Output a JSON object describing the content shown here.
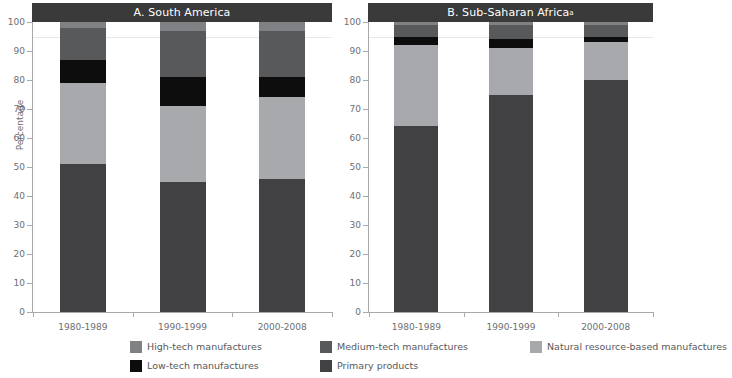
{
  "axis": {
    "ylabel": "Percentage",
    "yticks": [
      0,
      10,
      20,
      30,
      40,
      50,
      60,
      70,
      80,
      90,
      100
    ],
    "ylim": [
      0,
      100
    ]
  },
  "panels": [
    {
      "title": "A. South America",
      "superscript": ""
    },
    {
      "title": "B. Sub-Saharan Africa",
      "superscript": "a"
    }
  ],
  "categories": [
    "1980-1989",
    "1990-1999",
    "2000-2008"
  ],
  "legend": {
    "rows": [
      [
        {
          "label": "High-tech manufactures",
          "color": "#808184"
        },
        {
          "label": "Medium-tech manufactures",
          "color": "#58595b"
        },
        {
          "label": "Natural resource-based manufactures",
          "color": "#a7a9ac"
        }
      ],
      [
        {
          "label": "Low-tech manufactures",
          "color": "#0d0d0d"
        },
        {
          "label": "Primary products",
          "color": "#414042"
        }
      ]
    ]
  },
  "chart_data": {
    "type": "bar",
    "xlabel": "",
    "ylabel": "Percentage",
    "ylim": [
      0,
      100
    ],
    "grid": false,
    "stacked": true,
    "legend_position": "bottom",
    "categories": [
      "1980-1989",
      "1990-1999",
      "2000-2008"
    ],
    "panels": [
      {
        "name": "A. South America",
        "series": [
          {
            "name": "Primary products",
            "color": "#414042",
            "values": [
              51,
              45,
              46
            ]
          },
          {
            "name": "Natural resource-based manufactures",
            "color": "#a7a9ac",
            "values": [
              28,
              26,
              28
            ]
          },
          {
            "name": "Low-tech manufactures",
            "color": "#0d0d0d",
            "values": [
              8,
              10,
              7
            ]
          },
          {
            "name": "Medium-tech manufactures",
            "color": "#58595b",
            "values": [
              11,
              16,
              16
            ]
          },
          {
            "name": "High-tech manufactures",
            "color": "#808184",
            "values": [
              2,
              3,
              3
            ]
          }
        ]
      },
      {
        "name": "B. Sub-Saharan Africa",
        "series": [
          {
            "name": "Primary products",
            "color": "#414042",
            "values": [
              64,
              75,
              80
            ]
          },
          {
            "name": "Natural resource-based manufactures",
            "color": "#a7a9ac",
            "values": [
              28,
              16,
              13
            ]
          },
          {
            "name": "Low-tech manufactures",
            "color": "#0d0d0d",
            "values": [
              3,
              3,
              2
            ]
          },
          {
            "name": "Medium-tech manufactures",
            "color": "#58595b",
            "values": [
              4,
              5,
              4
            ]
          },
          {
            "name": "High-tech manufactures",
            "color": "#808184",
            "values": [
              1,
              1,
              1
            ]
          }
        ]
      }
    ]
  }
}
